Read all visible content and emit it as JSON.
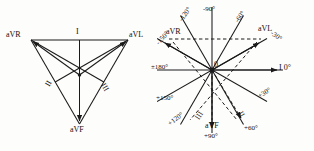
{
  "figure": {
    "panels": [
      {
        "id": "einthoven-triangle",
        "name": "Einthoven triangle with augmented leads",
        "vertices": [
          {
            "label": "aVR",
            "position": "top-left"
          },
          {
            "label": "aVL",
            "position": "top-right"
          },
          {
            "label": "aVF",
            "position": "bottom"
          }
        ],
        "lead_labels": [
          {
            "label": "I",
            "position": "top-center"
          },
          {
            "label": "II",
            "position": "lower-left"
          },
          {
            "label": "III",
            "position": "lower-right"
          }
        ]
      },
      {
        "id": "hexaxial-reference-system",
        "name": "Hexaxial reference system",
        "origin_label": "0",
        "axes": [
          {
            "lead": "I",
            "angle": "0°",
            "label": "I 0°"
          },
          {
            "lead": "",
            "angle": "+30°",
            "label": "+30°"
          },
          {
            "lead": "II",
            "angle": "+60°",
            "label": "+60°"
          },
          {
            "lead": "aVF",
            "angle": "+90°",
            "label": "+90°"
          },
          {
            "lead": "III",
            "angle": "+120°",
            "label": "+120°"
          },
          {
            "lead": "",
            "angle": "+150°",
            "label": "+150°"
          },
          {
            "lead": "",
            "angle": "±180°",
            "label": "±180°"
          },
          {
            "lead": "",
            "angle": "-150°",
            "label": "-150°"
          },
          {
            "lead": "aVR",
            "angle": "-120°",
            "label": "-120°"
          },
          {
            "lead": "",
            "angle": "-90°",
            "label": "-90°"
          },
          {
            "lead": "",
            "angle": "-60°",
            "label": "-60°"
          },
          {
            "lead": "aVL",
            "angle": "-30°",
            "label": "-30°"
          }
        ],
        "lead_names": [
          {
            "label": "aVR"
          },
          {
            "label": "aVL"
          },
          {
            "label": "aVF"
          },
          {
            "label": "I"
          },
          {
            "label": "II"
          },
          {
            "label": "III"
          }
        ]
      }
    ]
  },
  "left": {
    "aVR": "aVR",
    "aVL": "aVL",
    "aVF": "aVF",
    "lead_I": "I",
    "lead_II": "II",
    "lead_III": "III"
  },
  "right": {
    "origin": "0",
    "aVR": "aVR",
    "aVL": "aVL",
    "aVF": "aVF",
    "lead_I_zero": "I 0°",
    "lead_II": "II",
    "lead_III": "III",
    "ang_minus120": "-120°",
    "ang_minus90": "-90°",
    "ang_minus60": "-60°",
    "ang_minus30": "-30°",
    "ang_minus150": "-150°",
    "ang_pm180": "±180°",
    "ang_plus150": "+150°",
    "ang_plus120": "+120°",
    "ang_plus90": "+90°",
    "ang_plus60": "+60°",
    "ang_plus30": "+30°"
  },
  "colors": {
    "ink": "#1a1a1a",
    "paper": "#fdfdfc"
  }
}
